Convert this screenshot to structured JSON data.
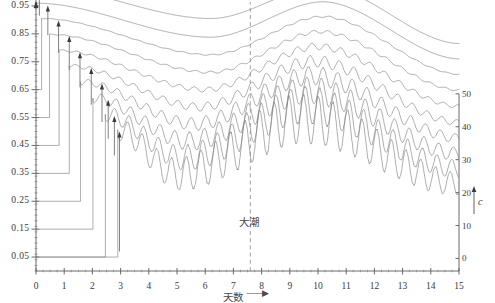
{
  "figure": {
    "background": "#ffffff",
    "line_color": "#7c7c7c",
    "axis_color": "#5a5a5a",
    "text_color": "#3a3a3a"
  },
  "annotations": {
    "spring_tide_label": "大潮",
    "spring_tide_x": 7.6,
    "x_axis_title": "天数",
    "x_axis_arrow": "——▶",
    "right_axis_title": "c"
  },
  "chart_data": {
    "type": "line",
    "title": "",
    "xlabel": "天数",
    "ylabel": "",
    "xlim": [
      0,
      15
    ],
    "ylim": [
      0.0,
      1.0
    ],
    "grid": false,
    "legend": "none",
    "x_ticks": [
      0,
      1,
      2,
      3,
      4,
      5,
      6,
      7,
      8,
      9,
      10,
      11,
      12,
      13,
      14,
      15
    ],
    "x_tick_labels": [
      "0",
      "1",
      "2",
      "3",
      "4",
      "5",
      "6",
      "7",
      "8",
      "9",
      "10",
      "11",
      "12",
      "13",
      "14",
      "15"
    ],
    "y_ticks": [
      0.05,
      0.15,
      0.25,
      0.35,
      0.45,
      0.55,
      0.65,
      0.75,
      0.85,
      0.95
    ],
    "y_tick_labels": [
      "0.05",
      "0.15",
      "0.25",
      "0.35",
      "0.45",
      "0.55",
      "0.65",
      "0.75",
      "0.85",
      "0.95"
    ],
    "secondary_axis": {
      "position": "right",
      "label": "c",
      "lim": [
        0,
        50
      ],
      "ticks": [
        0,
        10,
        20,
        30,
        40,
        50
      ],
      "tick_labels": [
        "0",
        "10",
        "20",
        "30",
        "40",
        "50"
      ]
    },
    "annotations": [
      {
        "text": "大潮",
        "x": 7.6,
        "kind": "dashed-vline"
      }
    ],
    "series": [
      {
        "name": "curve-1",
        "start_x": 0.0,
        "start_y": 1.02,
        "end_y": 0.815,
        "min_y": 0.905,
        "min_x": 6.2,
        "peak_y": 1.02,
        "peak_x": 10.2,
        "amplitude": 0.0,
        "arrow_x": 0.12,
        "arrow_from": 0.915,
        "arrow_to": 1.015
      },
      {
        "name": "curve-2",
        "start_x": 0.0,
        "start_y": 0.96,
        "end_y": 0.76,
        "min_y": 0.838,
        "min_x": 6.2,
        "peak_y": 0.965,
        "peak_x": 10.2,
        "amplitude": 0.0,
        "arrow_x": 0.42,
        "arrow_from": 0.845,
        "arrow_to": 0.952
      },
      {
        "name": "curve-3",
        "start_x": 0.2,
        "start_y": 0.905,
        "end_y": 0.705,
        "min_y": 0.775,
        "min_x": 6.2,
        "peak_y": 0.912,
        "peak_x": 10.2,
        "amplitude": 0.002,
        "arrow_x": 0.8,
        "arrow_from": 0.782,
        "arrow_to": 0.898
      },
      {
        "name": "curve-4",
        "start_x": 0.48,
        "start_y": 0.848,
        "end_y": 0.648,
        "min_y": 0.712,
        "min_x": 6.2,
        "peak_y": 0.858,
        "peak_x": 10.1,
        "amplitude": 0.004,
        "arrow_x": 1.18,
        "arrow_from": 0.72,
        "arrow_to": 0.842
      },
      {
        "name": "curve-5",
        "start_x": 0.82,
        "start_y": 0.79,
        "end_y": 0.59,
        "min_y": 0.65,
        "min_x": 6.0,
        "peak_y": 0.805,
        "peak_x": 10.0,
        "amplitude": 0.008,
        "arrow_x": 1.56,
        "arrow_from": 0.658,
        "arrow_to": 0.784
      },
      {
        "name": "curve-6",
        "start_x": 1.18,
        "start_y": 0.735,
        "end_y": 0.532,
        "min_y": 0.588,
        "min_x": 5.8,
        "peak_y": 0.752,
        "peak_x": 9.9,
        "amplitude": 0.014,
        "arrow_x": 1.96,
        "arrow_from": 0.596,
        "arrow_to": 0.728
      },
      {
        "name": "curve-7",
        "start_x": 1.58,
        "start_y": 0.678,
        "end_y": 0.476,
        "min_y": 0.527,
        "min_x": 5.6,
        "peak_y": 0.7,
        "peak_x": 9.8,
        "amplitude": 0.022,
        "arrow_x": 2.34,
        "arrow_from": 0.534,
        "arrow_to": 0.672
      },
      {
        "name": "curve-8",
        "start_x": 2.02,
        "start_y": 0.62,
        "end_y": 0.42,
        "min_y": 0.466,
        "min_x": 5.4,
        "peak_y": 0.648,
        "peak_x": 9.7,
        "amplitude": 0.032,
        "arrow_x": 2.56,
        "arrow_from": 0.474,
        "arrow_to": 0.614
      },
      {
        "name": "curve-9",
        "start_x": 2.46,
        "start_y": 0.562,
        "end_y": 0.366,
        "min_y": 0.406,
        "min_x": 5.2,
        "peak_y": 0.596,
        "peak_x": 9.6,
        "amplitude": 0.044,
        "arrow_x": 2.78,
        "arrow_from": 0.414,
        "arrow_to": 0.556
      },
      {
        "name": "curve-10",
        "start_x": 2.9,
        "start_y": 0.506,
        "end_y": 0.312,
        "min_y": 0.348,
        "min_x": 5.0,
        "peak_y": 0.546,
        "peak_x": 9.5,
        "amplitude": 0.058,
        "arrow_x": 2.96,
        "arrow_from": 0.07,
        "arrow_to": 0.5
      }
    ],
    "staircase": {
      "description": "each curve drops vertically from its onset to a lower baseline and runs horizontally back to the y-axis",
      "levels": [
        0.05,
        0.15,
        0.25,
        0.35,
        0.45,
        0.55,
        0.65,
        0.75,
        0.85
      ]
    }
  }
}
